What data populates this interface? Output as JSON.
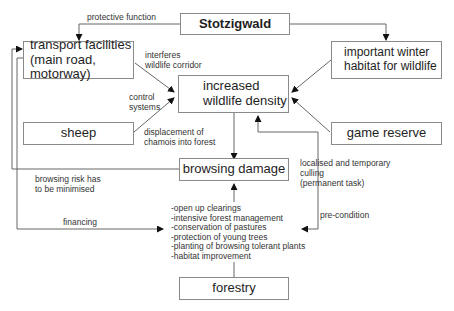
{
  "diagram": {
    "nodes": {
      "stotzigwald": "Stotzigwald",
      "transport_line1": "transport facilities",
      "transport_line2": "(main road, motorway)",
      "winter_line1": "important winter",
      "winter_line2": "habitat for wildlife",
      "density_line1": "increased",
      "density_line2": "wildlife density",
      "sheep": "sheep",
      "game_reserve": "game reserve",
      "browsing_damage": "browsing damage",
      "forestry": "forestry"
    },
    "edge_labels": {
      "protective_function": "protective function",
      "interferes_line1": "interferes",
      "interferes_line2": "wildlife corridor",
      "control_line1": "control",
      "control_line2": "systems",
      "displacement_line1": "displacement of",
      "displacement_line2": "chamois into forest",
      "risk_line1": "browsing risk has",
      "risk_line2": "to be minimised",
      "culling_line1": "localised and temporary",
      "culling_line2": "culling",
      "culling_line3": "(permanent task)",
      "pre_condition": "pre-condition",
      "financing": "financing"
    },
    "measures": [
      "-open up clearings",
      "-intensive forest management",
      "-conservation of pastures",
      "-protection of young trees",
      "-planting of browsing tolerant plants",
      "-habitat improvement"
    ],
    "colors": {
      "line": "#555555",
      "border": "#8a8a8a",
      "text": "#1e1e1e"
    }
  }
}
